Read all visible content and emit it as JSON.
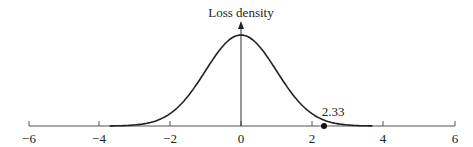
{
  "chart_data": {
    "type": "line",
    "title": "",
    "ylabel": "Loss density",
    "xlabel": "",
    "xlim": [
      -6,
      6
    ],
    "x_ticks": [
      -6,
      -4,
      -2,
      0,
      2,
      4,
      6
    ],
    "x_tick_labels": [
      "−6",
      "−4",
      "−2",
      "0",
      "2",
      "4",
      "6"
    ],
    "grid": false,
    "series": [
      {
        "name": "Standard normal loss density",
        "distribution": "normal",
        "mean": 0,
        "sd": 1,
        "x_range": [
          -3.7,
          3.7
        ]
      }
    ],
    "annotations": [
      {
        "type": "point",
        "x": 2.33,
        "label": "2.33"
      }
    ]
  },
  "labels": {
    "y_axis": "Loss density",
    "marker": "2.33",
    "ticks": [
      "−6",
      "−4",
      "−2",
      "0",
      "2",
      "4",
      "6"
    ]
  }
}
